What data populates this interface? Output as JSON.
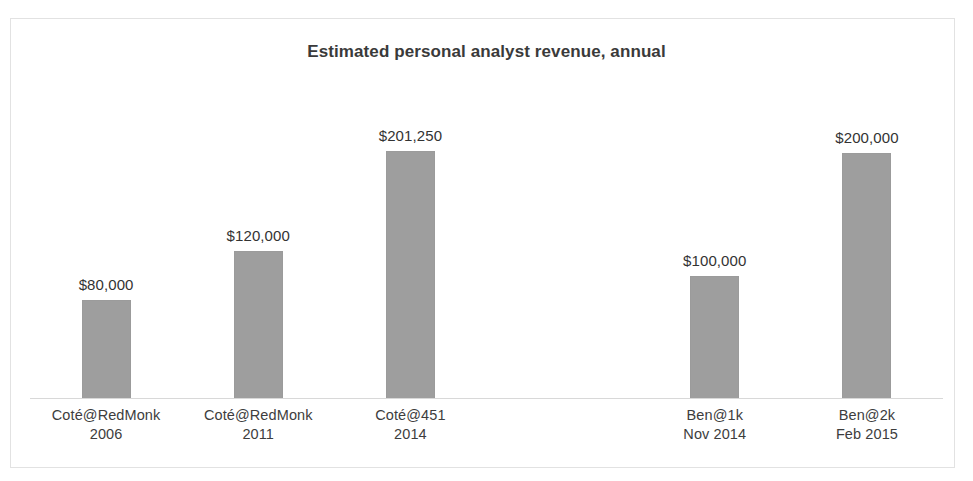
{
  "chart_data": {
    "type": "bar",
    "title": "Estimated personal analyst revenue, annual",
    "xlabel": "",
    "ylabel": "",
    "grid": false,
    "legend": false,
    "axis_baseline_visible": true,
    "ylim": [
      0,
      201250
    ],
    "bar_color": "#9e9e9e",
    "text_color": "#333333",
    "background": "#ffffff",
    "categories": [
      "Coté@RedMonk 2006",
      "Coté@RedMonk 2011",
      "Coté@451 2014",
      "",
      "Ben@1k Nov 2014",
      "Ben@2k Feb 2015"
    ],
    "category_lines": [
      {
        "line1": "Coté@RedMonk",
        "line2": "2006"
      },
      {
        "line1": "Coté@RedMonk",
        "line2": "2011"
      },
      {
        "line1": "Coté@451",
        "line2": "2014"
      },
      {
        "line1": "",
        "line2": ""
      },
      {
        "line1": "Ben@1k",
        "line2": "Nov 2014"
      },
      {
        "line1": "Ben@2k",
        "line2": "Feb 2015"
      }
    ],
    "values": [
      80000,
      120000,
      201250,
      null,
      100000,
      200000
    ],
    "value_labels": [
      "$80,000",
      "$120,000",
      "$201,250",
      "",
      "$100,000",
      "$200,000"
    ]
  }
}
